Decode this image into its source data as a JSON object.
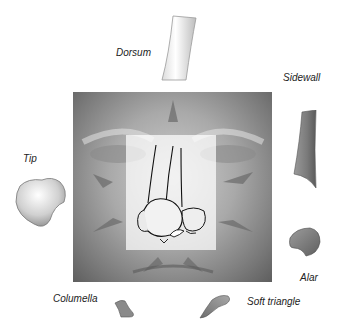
{
  "figure": {
    "type": "nasal subunit diagram",
    "center_image": "face with nasal subunits overlay",
    "labels": {
      "dorsum": "Dorsum",
      "sidewall": "Sidewall",
      "tip": "Tip",
      "alar": "Alar",
      "columella": "Columella",
      "soft_triangle": "Soft triangle"
    }
  },
  "colors": {
    "background": "#ffffff",
    "face_light": "#cfcfcf",
    "face_dark": "#5e5e5e",
    "overlay": "#ffffff",
    "outline": "#111111",
    "label_text": "#222222"
  }
}
